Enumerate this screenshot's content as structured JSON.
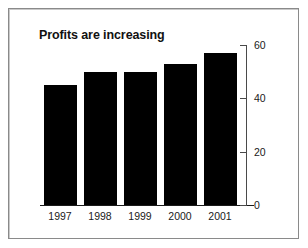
{
  "chart_data": {
    "type": "bar",
    "title": "Profits are increasing",
    "categories": [
      "1997",
      "1998",
      "1999",
      "2000",
      "2001"
    ],
    "values": [
      45,
      50,
      50,
      53,
      57
    ],
    "series": [
      {
        "name": "Profits",
        "values": [
          45,
          50,
          50,
          53,
          57
        ]
      }
    ],
    "xlabel": "",
    "ylabel": "",
    "ylim": [
      0,
      60
    ],
    "yticks": [
      0,
      20,
      40,
      60
    ],
    "ytick_labels": [
      "0",
      "20",
      "40",
      "60"
    ],
    "grid": false,
    "legend": false,
    "axis_position": "right",
    "bar_color": "#000000",
    "background_color": "#ffffff",
    "border_color": "#8a8a8a"
  },
  "axis": {
    "ticks": [
      {
        "label": "60",
        "value": 60
      },
      {
        "label": "40",
        "value": 40
      },
      {
        "label": "20",
        "value": 20
      },
      {
        "label": "0",
        "value": 0
      }
    ]
  },
  "bars": [
    {
      "category": "1997",
      "value": 45
    },
    {
      "category": "1998",
      "value": 50
    },
    {
      "category": "1999",
      "value": 50
    },
    {
      "category": "2000",
      "value": 53
    },
    {
      "category": "2001",
      "value": 57
    }
  ]
}
